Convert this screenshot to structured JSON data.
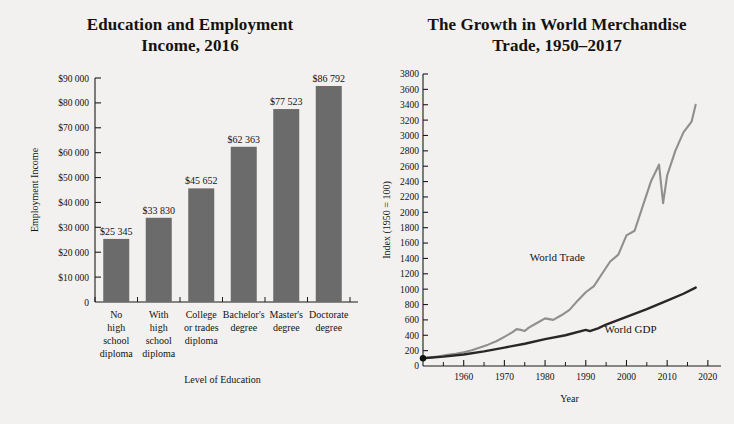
{
  "chart_data": [
    {
      "type": "bar",
      "title": "Education and Employment Income, 2016",
      "title_line1": "Education and Employment",
      "title_line2": "Income, 2016",
      "xlabel": "Level of Education",
      "ylabel": "Employment Income",
      "ylim": [
        0,
        90000
      ],
      "ytick_step": 10000,
      "grid": false,
      "bar_color": "#6b6b6b",
      "ytick_labels": [
        "0",
        "$10 000",
        "$20 000",
        "$30 000",
        "$40 000",
        "$50 000",
        "$60 000",
        "$70 000",
        "$80 000",
        "$90 000"
      ],
      "categories": [
        "No high school diploma",
        "With high school diploma",
        "College or trades diploma",
        "Bachelor's degree",
        "Master's degree",
        "Doctorate degree"
      ],
      "category_lines": [
        [
          "No",
          "high",
          "school",
          "diploma"
        ],
        [
          "With",
          "high",
          "school",
          "diploma"
        ],
        [
          "College",
          "or trades",
          "diploma"
        ],
        [
          "Bachelor's",
          "degree"
        ],
        [
          "Master's",
          "degree"
        ],
        [
          "Doctorate",
          "degree"
        ]
      ],
      "values": [
        25345,
        33830,
        45652,
        62363,
        77523,
        86792
      ],
      "value_labels": [
        "$25 345",
        "$33 830",
        "$45 652",
        "$62 363",
        "$77 523",
        "$86 792"
      ]
    },
    {
      "type": "line",
      "title": "The Growth in World Merchandise Trade, 1950–2017",
      "title_line1": "The Growth in World Merchandise",
      "title_line2": "Trade, 1950–2017",
      "xlabel": "Year",
      "ylabel": "Index (1950 = 100)",
      "ylim": [
        0,
        3800
      ],
      "ytick_step": 200,
      "xlim": [
        1950,
        2022
      ],
      "xtick_labels": [
        "1960",
        "1970",
        "1980",
        "1990",
        "2000",
        "2010",
        "2020"
      ],
      "xtick_values": [
        1960,
        1970,
        1980,
        1990,
        2000,
        2010,
        2020
      ],
      "xtick_minor_values": [
        1955,
        1965,
        1975,
        1985,
        1995,
        2005,
        2015
      ],
      "ytick_labels": [
        "0",
        "200",
        "400",
        "600",
        "800",
        "1000",
        "1200",
        "1400",
        "1600",
        "1800",
        "2000",
        "2200",
        "2400",
        "2600",
        "2800",
        "3000",
        "3200",
        "3400",
        "3600",
        "3800"
      ],
      "grid": false,
      "legend_position": "inline-annotations",
      "series": [
        {
          "name": "World Trade",
          "color": "#8f8f8f",
          "label_x": 1983,
          "label_y": 1360,
          "x": [
            1950,
            1952,
            1954,
            1956,
            1958,
            1960,
            1962,
            1964,
            1966,
            1968,
            1970,
            1972,
            1973,
            1974,
            1975,
            1976,
            1978,
            1980,
            1982,
            1984,
            1986,
            1988,
            1990,
            1992,
            1994,
            1996,
            1998,
            2000,
            2002,
            2004,
            2006,
            2008,
            2009,
            2010,
            2012,
            2014,
            2016,
            2017
          ],
          "values": [
            100,
            112,
            126,
            146,
            158,
            180,
            205,
            240,
            278,
            322,
            380,
            440,
            480,
            470,
            455,
            500,
            560,
            620,
            600,
            660,
            730,
            850,
            960,
            1040,
            1200,
            1360,
            1450,
            1700,
            1760,
            2080,
            2400,
            2620,
            2120,
            2480,
            2800,
            3040,
            3180,
            3400
          ]
        },
        {
          "name": "World GDP",
          "color": "#272727",
          "label_x": 2001,
          "label_y": 430,
          "x": [
            1950,
            1955,
            1960,
            1965,
            1970,
            1975,
            1980,
            1985,
            1990,
            1991,
            1993,
            1995,
            2000,
            2005,
            2010,
            2014,
            2017
          ],
          "values": [
            100,
            122,
            150,
            190,
            240,
            290,
            350,
            400,
            470,
            455,
            490,
            540,
            640,
            740,
            850,
            940,
            1020
          ]
        }
      ]
    }
  ]
}
